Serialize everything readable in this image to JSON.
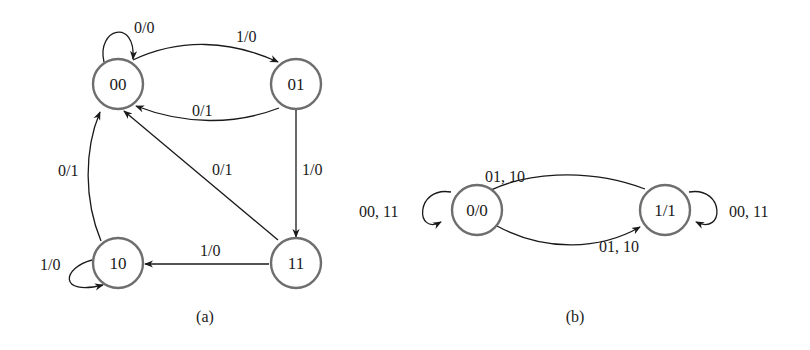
{
  "diagram_a": {
    "caption": "(a)",
    "states": [
      {
        "id": "00",
        "label": "00"
      },
      {
        "id": "01",
        "label": "01"
      },
      {
        "id": "10",
        "label": "10"
      },
      {
        "id": "11",
        "label": "11"
      }
    ],
    "transitions": [
      {
        "from": "00",
        "to": "00",
        "label": "0/0"
      },
      {
        "from": "00",
        "to": "01",
        "label": "1/0"
      },
      {
        "from": "01",
        "to": "00",
        "label": "0/1"
      },
      {
        "from": "01",
        "to": "11",
        "label": "1/0"
      },
      {
        "from": "11",
        "to": "00",
        "label": "0/1"
      },
      {
        "from": "11",
        "to": "10",
        "label": "1/0"
      },
      {
        "from": "10",
        "to": "00",
        "label": "0/1"
      },
      {
        "from": "10",
        "to": "10",
        "label": "1/0"
      }
    ]
  },
  "diagram_b": {
    "caption": "(b)",
    "states": [
      {
        "id": "0/0",
        "label": "0/0"
      },
      {
        "id": "1/1",
        "label": "1/1"
      }
    ],
    "transitions": [
      {
        "from": "0/0",
        "to": "0/0",
        "label": "00, 11"
      },
      {
        "from": "1/1",
        "to": "0/0",
        "label": "01, 10"
      },
      {
        "from": "0/0",
        "to": "1/1",
        "label": "01, 10"
      },
      {
        "from": "1/1",
        "to": "1/1",
        "label": "00, 11"
      }
    ]
  },
  "colors": {
    "state_stroke": "#6e6e6e",
    "edge_stroke": "#1a1a1a",
    "background": "#ffffff"
  }
}
